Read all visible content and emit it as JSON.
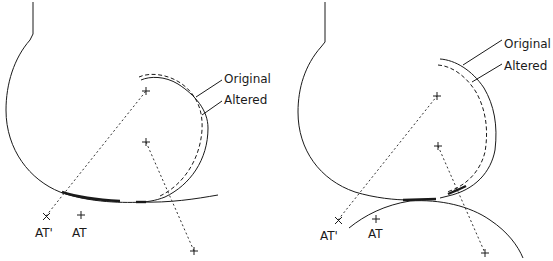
{
  "panels": [
    {
      "id": "left",
      "legend": {
        "original_label": "Original",
        "altered_label": "Altered"
      },
      "points": {
        "at_prime_label": "AT'",
        "at_label": "AT"
      }
    },
    {
      "id": "right",
      "legend": {
        "original_label": "Original",
        "altered_label": "Altered"
      },
      "points": {
        "at_prime_label": "AT'",
        "at_label": "AT"
      }
    }
  ],
  "colors": {
    "stroke": "#1a1a1a",
    "background": "#ffffff"
  }
}
